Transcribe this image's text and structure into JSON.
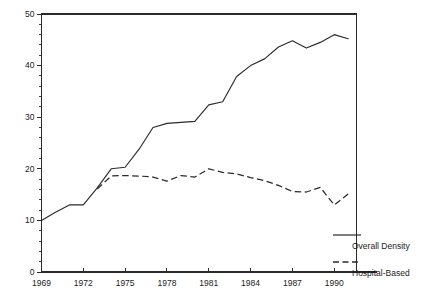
{
  "chart_data": {
    "type": "line",
    "title": "",
    "subtitle": "",
    "xlabel": "",
    "ylabel": "",
    "xlim": [
      1969,
      1991.6
    ],
    "ylim": [
      0,
      50
    ],
    "grid": false,
    "legend_position": "right",
    "x_ticks": [
      1969,
      1972,
      1975,
      1978,
      1981,
      1984,
      1987,
      1990
    ],
    "x_tick_labels": [
      "1969",
      "1972",
      "1975",
      "1978",
      "1981",
      "1984",
      "1987",
      "1990"
    ],
    "y_ticks": [
      0,
      10,
      20,
      30,
      40,
      50
    ],
    "y_tick_labels": [
      "0",
      "10",
      "20",
      "30",
      "40",
      "50"
    ],
    "y_minor_tick_step": 2,
    "x": [
      1969,
      1970,
      1971,
      1972,
      1973,
      1974,
      1975,
      1976,
      1977,
      1978,
      1979,
      1980,
      1981,
      1982,
      1983,
      1984,
      1985,
      1986,
      1987,
      1988,
      1989,
      1990,
      1991
    ],
    "series": [
      {
        "name": "Overall Density",
        "style": "solid",
        "color": "#2b2b2b",
        "values": [
          10.0,
          11.6,
          13.0,
          13.0,
          16.3,
          20.0,
          20.3,
          23.8,
          28.0,
          28.8,
          29.0,
          29.2,
          32.4,
          33.0,
          37.9,
          40.0,
          41.3,
          43.6,
          44.8,
          43.4,
          44.5,
          46.0,
          45.2
        ]
      },
      {
        "name": "Hospital-Based",
        "style": "dashed",
        "color": "#2b2b2b",
        "values": [
          null,
          null,
          null,
          null,
          16.1,
          18.6,
          18.7,
          18.6,
          18.4,
          17.6,
          18.7,
          18.4,
          20.0,
          19.3,
          19.0,
          18.3,
          17.7,
          16.8,
          15.6,
          15.5,
          16.4,
          13.0,
          15.1
        ]
      }
    ]
  },
  "legend": {
    "entries": [
      {
        "label": "Overall Density",
        "style": "solid"
      },
      {
        "label": "Hospital-Based",
        "style": "dashed"
      }
    ]
  }
}
